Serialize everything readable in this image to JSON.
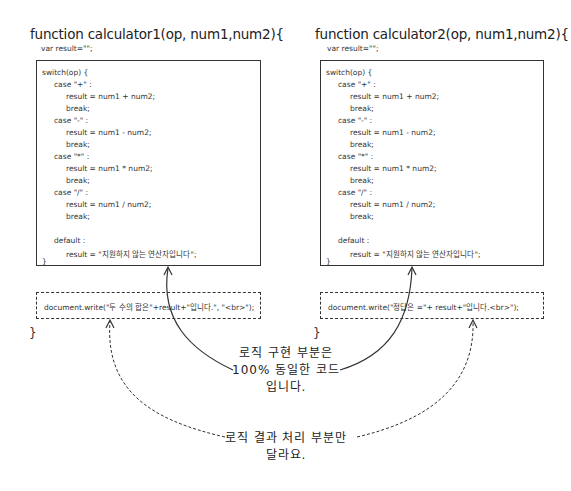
{
  "left": {
    "title": "function calculator1(op, num1,num2){",
    "var_line": "var result=\"\";",
    "code_lines": [
      "switch(op) {",
      "case \"+\" :",
      "result = num1 + num2;",
      "break;",
      "case \"-\" :",
      "result = num1 - num2;",
      "break;",
      "case \"*\" :",
      "result = num1 * num2;",
      "break;",
      "case \"/\" :",
      "result = num1 / num2;",
      "break;",
      "default :",
      "result = \"지원하지 않는 연산자입니다\";",
      "}"
    ],
    "output_line": "document.write(\"두 수의 합은\"+result+\"입니다.\", \"<br>\");",
    "closing_brace": "}"
  },
  "right": {
    "title": "function calculator2(op, num1,num2){",
    "var_line": "var result=\"\";",
    "code_lines": [
      "switch(op) {",
      "case \"+\" :",
      "result = num1 + num2;",
      "break;",
      "case \"-\" :",
      "result = num1 - num2;",
      "break;",
      "case \"*\" :",
      "result = num1 * num2;",
      "break;",
      "case \"/\" :",
      "result = num1 / num2;",
      "break;",
      "default :",
      "result = \"지원하지 않는 연산자입니다\";",
      "}"
    ],
    "output_line": "document.write(\"정답은 =\"+ result+\"입니다.<br>\");",
    "closing_brace": "}"
  },
  "annotations": {
    "same_logic": [
      "로직 구현 부분은",
      "100% 동일한 코드",
      "입니다."
    ],
    "different_output": [
      "로직 결과 처리 부분만",
      "달라요."
    ]
  },
  "colors": {
    "line": "#333333",
    "text": "#222222",
    "background": "#ffffff"
  }
}
